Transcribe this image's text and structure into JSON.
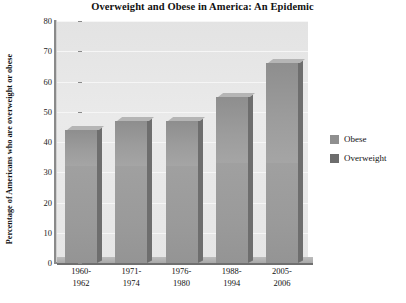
{
  "chart_data": {
    "type": "bar",
    "subtype": "stacked-bar-3d",
    "title": "Overweight and Obese in America: An Epidemic",
    "xlabel": "",
    "ylabel": "Percentage of Americans who are overweight or obese",
    "ylabel_line1": "Percentage of Americans who are",
    "ylabel_line2": "overweight or obese",
    "ylim": [
      0,
      80
    ],
    "ytick_step": 10,
    "yticks": [
      "0",
      "10",
      "20",
      "30",
      "40",
      "50",
      "60",
      "70",
      "80"
    ],
    "grid": true,
    "legend_position": "right",
    "categories": [
      "1960-\n1962",
      "1971-\n1974",
      "1976-\n1980",
      "1988-\n1994",
      "2005-\n2006"
    ],
    "category_lines": [
      [
        "1960-",
        "1962"
      ],
      [
        "1971-",
        "1974"
      ],
      [
        "1976-",
        "1980"
      ],
      [
        "1988-",
        "1994"
      ],
      [
        "2005-",
        "2006"
      ]
    ],
    "series": [
      {
        "name": "Overweight",
        "color": "#6d6d6d",
        "values": [
          32,
          32,
          32,
          33,
          33
        ]
      },
      {
        "name": "Obese",
        "color": "#8f8f8f",
        "values": [
          12,
          15,
          15,
          22,
          33
        ]
      }
    ],
    "totals": [
      44,
      47,
      47,
      55,
      66
    ],
    "plot_background": "#e8e8e8",
    "gridline_color": "#f6f6f6",
    "axis_color": "#8a8a8a"
  },
  "legend": {
    "items": [
      {
        "label": "Obese",
        "swatch": "obese"
      },
      {
        "label": "Overweight",
        "swatch": "overweight"
      }
    ]
  }
}
